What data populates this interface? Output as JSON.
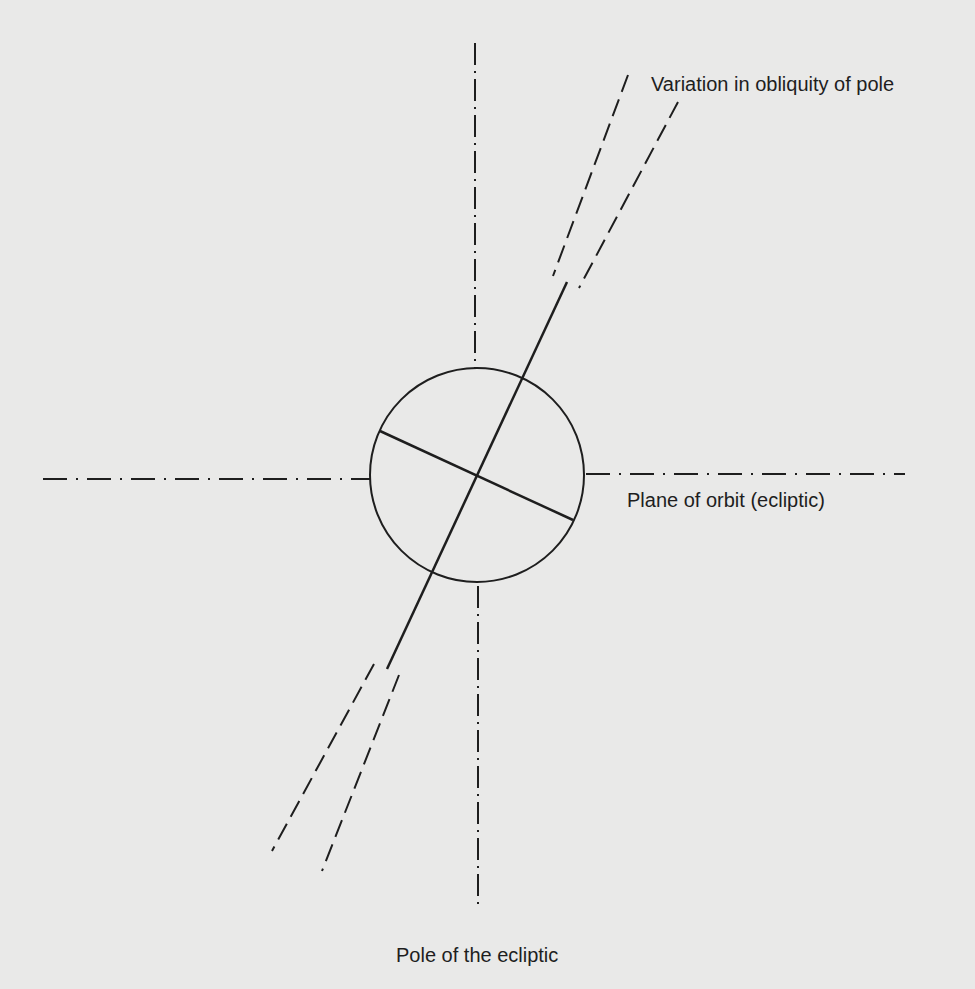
{
  "diagram": {
    "labels": {
      "obliquity": "Variation in obliquity of pole",
      "plane": "Plane of orbit (ecliptic)",
      "pole": "Pole of the ecliptic"
    },
    "colors": {
      "background": "#e9e9e8",
      "stroke": "#1e1e1e",
      "text": "#1e1e1e"
    },
    "elements": {
      "globe": {
        "cx": 477,
        "cy": 475,
        "r": 107
      },
      "rotation_axis": {
        "x1": 567,
        "y1": 282,
        "x2": 387,
        "y2": 669
      },
      "equator": {
        "x1": 380,
        "y1": 431,
        "x2": 573,
        "y2": 520
      },
      "ecliptic_pole_axis_top": {
        "x1": 475,
        "y1": 43,
        "x2": 475,
        "y2": 368
      },
      "ecliptic_pole_axis_bottom": {
        "x1": 478,
        "y1": 584,
        "x2": 478,
        "y2": 908
      },
      "ecliptic_plane_left": {
        "x1": 43,
        "y1": 479,
        "x2": 370,
        "y2": 479
      },
      "ecliptic_plane_right": {
        "x1": 584,
        "y1": 474,
        "x2": 905,
        "y2": 474
      },
      "obliquity_upper_left": {
        "x1": 628,
        "y1": 75,
        "x2": 553,
        "y2": 276
      },
      "obliquity_upper_right": {
        "x1": 678,
        "y1": 102,
        "x2": 579,
        "y2": 288
      },
      "obliquity_lower_left": {
        "x1": 374,
        "y1": 664,
        "x2": 272,
        "y2": 851
      },
      "obliquity_lower_right": {
        "x1": 399,
        "y1": 675,
        "x2": 322,
        "y2": 871
      }
    }
  }
}
